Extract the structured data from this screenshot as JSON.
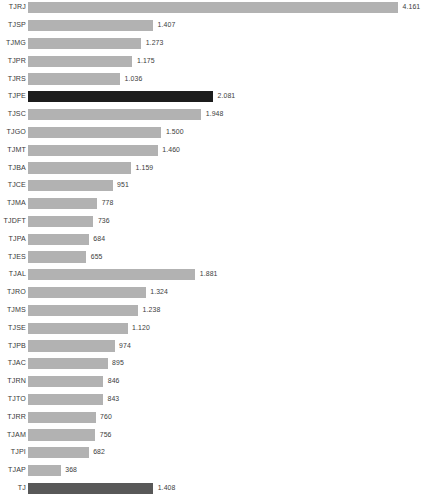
{
  "chart_data": {
    "type": "bar",
    "orientation": "horizontal",
    "title": "",
    "subtitle": "",
    "xlabel": "",
    "ylabel": "",
    "grid": false,
    "legend": false,
    "axis_visible": false,
    "value_labels_shown": true,
    "xlim": [
      0,
      4.161
    ],
    "colors": {
      "default_bar": "#b2b2b2",
      "highlight_bar": "#1c1c1c",
      "total_bar": "#585858",
      "label_text": "#3a3a3a",
      "background": "#ffffff"
    },
    "categories": [
      "TJRJ",
      "TJSP",
      "TJMG",
      "TJPR",
      "TJRS",
      "TJPE",
      "TJSC",
      "TJGO",
      "TJMT",
      "TJBA",
      "TJCE",
      "TJMA",
      "TJDFT",
      "TJPA",
      "TJES",
      "TJAL",
      "TJRO",
      "TJMS",
      "TJSE",
      "TJPB",
      "TJAC",
      "TJRN",
      "TJTO",
      "TJRR",
      "TJAM",
      "TJPI",
      "TJAP",
      "TJ"
    ],
    "values": [
      4.161,
      1.407,
      1.273,
      1.175,
      1.036,
      2.081,
      1.948,
      1.5,
      1.46,
      1.159,
      0.951,
      0.778,
      0.736,
      0.684,
      0.655,
      1.881,
      1.324,
      1.238,
      1.12,
      0.974,
      0.895,
      0.846,
      0.843,
      0.76,
      0.756,
      0.682,
      0.368,
      1.408
    ],
    "value_labels": [
      "4.161",
      "1.407",
      "1.273",
      "1.175",
      "1.036",
      "2.081",
      "1.948",
      "1.500",
      "1.460",
      "1.159",
      "951",
      "778",
      "736",
      "684",
      "655",
      "1.881",
      "1.324",
      "1.238",
      "1.120",
      "974",
      "895",
      "846",
      "843",
      "760",
      "756",
      "682",
      "368",
      "1.408"
    ],
    "bar_styles": [
      "default",
      "default",
      "default",
      "default",
      "default",
      "highlight",
      "default",
      "default",
      "default",
      "default",
      "default",
      "default",
      "default",
      "default",
      "default",
      "default",
      "default",
      "default",
      "default",
      "default",
      "default",
      "default",
      "default",
      "default",
      "default",
      "default",
      "default",
      "total"
    ]
  }
}
